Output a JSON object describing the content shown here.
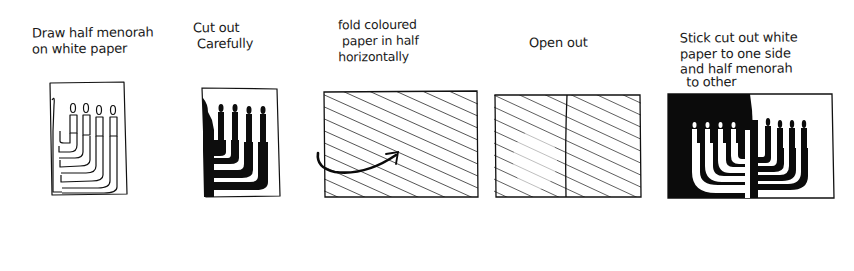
{
  "colors": {
    "ink": "#111111",
    "paper": "#ffffff"
  },
  "steps": [
    {
      "number": 1,
      "caption_lines": [
        "Draw half menorah",
        "on white paper"
      ],
      "illustration": "half-menorah-outline-on-white-paper",
      "candles": 5
    },
    {
      "number": 2,
      "caption_lines": [
        "Cut out",
        "Carefully"
      ],
      "illustration": "half-menorah-cut-out",
      "candles": 5
    },
    {
      "number": 3,
      "caption_lines": [
        "fold coloured",
        "paper in half",
        "horizontally"
      ],
      "illustration": "hatched-coloured-paper-with-fold-arrow"
    },
    {
      "number": 4,
      "caption_lines": [
        "Open out"
      ],
      "illustration": "hatched-paper-opened-with-centre-crease"
    },
    {
      "number": 5,
      "caption_lines": [
        "Stick cut out white",
        "paper to one side",
        "and half menorah",
        "to other"
      ],
      "illustration": "full-menorah-black-and-white-halves",
      "candles": 9
    }
  ]
}
